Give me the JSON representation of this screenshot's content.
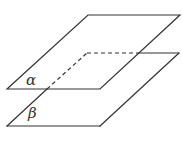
{
  "diagram": {
    "type": "two parallel planes",
    "stroke_color": "#333333",
    "background": "#ffffff",
    "planes": [
      {
        "name": "alpha",
        "label": "α",
        "vertices": [
          [
            7,
            89
          ],
          [
            100,
            89
          ],
          [
            180,
            15
          ],
          [
            88,
            15
          ]
        ],
        "label_pos": [
          26,
          73
        ]
      },
      {
        "name": "beta",
        "label": "β",
        "vertices": [
          [
            7,
            126
          ],
          [
            100,
            126
          ],
          [
            179,
            53
          ],
          [
            87,
            53
          ]
        ],
        "label_pos": [
          28,
          106
        ],
        "hidden_segments": [
          [
            [
              47,
              89
            ],
            [
              87,
              53
            ]
          ],
          [
            [
              87,
              53
            ],
            [
              139,
              53
            ]
          ]
        ]
      }
    ]
  }
}
